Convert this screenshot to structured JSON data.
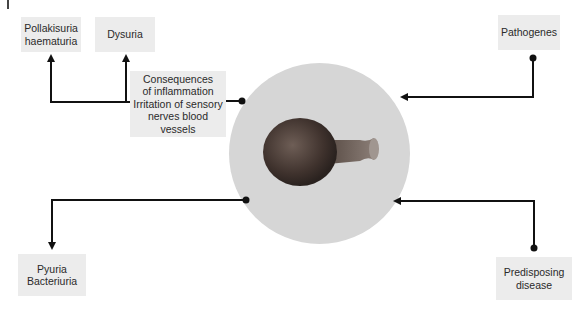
{
  "diagram": {
    "center": {
      "label": "bladder-organ",
      "fill": "#d6d6d6",
      "organ_color": "#5a4a44"
    },
    "boxes": {
      "pollakisuria": "Pollakisuria\nhaematuria",
      "dysuria": "Dysuria",
      "consequences": "Consequences\nof inflammation\nIrritation of sensory\nnerves blood\nvessels",
      "pathogenes": "Pathogenes",
      "pyuria": "Pyuria\nBacteriuria",
      "predisposing": "Predisposing\ndisease"
    },
    "connections": [
      {
        "from": "consequences",
        "to": "pollakisuria"
      },
      {
        "from": "consequences",
        "to": "dysuria"
      },
      {
        "from": "pathogenes",
        "to": "center"
      },
      {
        "from": "center",
        "to": "pyuria"
      },
      {
        "from": "predisposing",
        "to": "center"
      },
      {
        "from": "center",
        "to": "consequences"
      }
    ],
    "colors": {
      "box_bg": "#ececec",
      "line": "#111111"
    }
  }
}
